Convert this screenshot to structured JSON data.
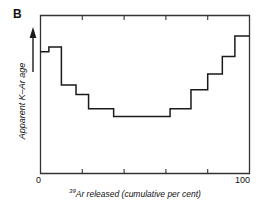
{
  "panel": {
    "label": "B"
  },
  "axes": {
    "ylabel": "Apparent K–Ar age",
    "xlabel_prefix": "39",
    "xlabel": "Ar released (cumulative per cent)",
    "xlabel_full": "39Ar released (cumulative per cent)",
    "x_tick_labels": {
      "min": "0",
      "max": "100"
    },
    "y_arrow": "increasing-age-arrow"
  },
  "colors": {
    "line": "#1a1a1a",
    "frame": "#333333",
    "background": "#ffffff",
    "text": "#111111"
  },
  "chart_data": {
    "type": "line",
    "title": "",
    "subtitle": "",
    "xlabel": "39Ar released (cumulative per cent)",
    "ylabel": "Apparent K–Ar age",
    "xlim": [
      0,
      100
    ],
    "ylim": [
      0,
      100
    ],
    "grid": false,
    "legend": null,
    "x_ticks": [
      0,
      20,
      40,
      60,
      80,
      100
    ],
    "x_tick_labels": [
      "0",
      "",
      "",
      "",
      "",
      "100"
    ],
    "y_ticks": [],
    "y_tick_labels": [],
    "annotations": [
      {
        "text": "B",
        "x": 0,
        "y": 100,
        "role": "panel-label"
      }
    ],
    "series": [
      {
        "name": "Apparent K–Ar age spectrum",
        "style": "step",
        "steps": [
          {
            "x_start": 0,
            "x_end": 4,
            "value": 77
          },
          {
            "x_start": 4,
            "x_end": 10,
            "value": 80
          },
          {
            "x_start": 10,
            "x_end": 17,
            "value": 56
          },
          {
            "x_start": 17,
            "x_end": 23,
            "value": 50
          },
          {
            "x_start": 23,
            "x_end": 35,
            "value": 41
          },
          {
            "x_start": 35,
            "x_end": 62,
            "value": 36
          },
          {
            "x_start": 62,
            "x_end": 72,
            "value": 41
          },
          {
            "x_start": 72,
            "x_end": 80,
            "value": 53
          },
          {
            "x_start": 80,
            "x_end": 87,
            "value": 63
          },
          {
            "x_start": 87,
            "x_end": 93,
            "value": 74
          },
          {
            "x_start": 93,
            "x_end": 100,
            "value": 87
          }
        ]
      }
    ]
  }
}
